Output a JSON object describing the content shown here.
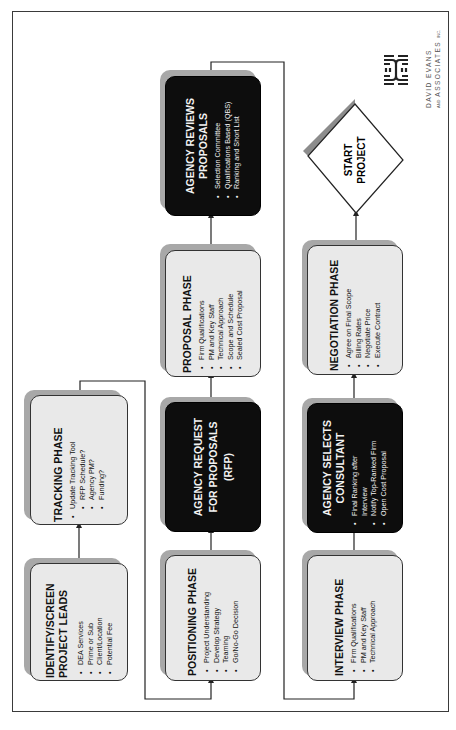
{
  "diagram": {
    "orientation": "rotated 90 degrees counter-clockwise",
    "company": {
      "name_line1": "DAVID EVANS",
      "name_line2": "ASSOCIATES",
      "name_prefix": "AND",
      "name_suffix": "INC."
    },
    "nodes": [
      {
        "id": "identify",
        "title": "IDENTIFY/SCREEN PROJECT LEADS",
        "title_lines": [
          "IDENTIFY/SCREEN",
          "PROJECT LEADS"
        ],
        "style": "light",
        "bullets": [
          "DEA Services",
          "Prime or Sub",
          "Client/Location",
          "Potential Fee"
        ]
      },
      {
        "id": "tracking",
        "title": "TRACKING PHASE",
        "style": "light",
        "bullets": [
          "Update Tracking Tool"
        ],
        "sub_bullets": [
          "RFP Schedule?",
          "Agency PM?",
          "Funding?"
        ]
      },
      {
        "id": "positioning",
        "title": "POSITIONING PHASE",
        "style": "light",
        "bullets": [
          "Project Understanding",
          "Develop Strategy",
          "Teaming",
          "Go/No-Go Decision"
        ]
      },
      {
        "id": "rfp",
        "title": "AGENCY REQUEST FOR PROPOSALS (RFP)",
        "title_lines": [
          "AGENCY REQUEST",
          "FOR PROPOSALS",
          "(RFP)"
        ],
        "style": "dark",
        "bullets": []
      },
      {
        "id": "proposal",
        "title": "PROPOSAL PHASE",
        "style": "light",
        "bullets": [
          "Firm Qualifications",
          "PM and Key Staff",
          "Technical Approach",
          "Scope and Schedule",
          "Sealed  Cost Proposal"
        ]
      },
      {
        "id": "reviews",
        "title": "AGENCY REVIEWS PROPOSALS",
        "title_lines": [
          "AGENCY REVIEWS",
          "PROPOSALS"
        ],
        "style": "dark",
        "bullets": [
          "Selection Committee",
          "Qualifications Based (QBS)",
          "Ranking and Short List"
        ]
      },
      {
        "id": "interview",
        "title": "INTERVIEW PHASE",
        "style": "light",
        "bullets": [
          "Firm Qualifications",
          "PM and Key Staff",
          "Technical Approach"
        ]
      },
      {
        "id": "selects",
        "title": "AGENCY SELECTS CONSULTANT",
        "title_lines": [
          "AGENCY SELECTS",
          "CONSULTANT"
        ],
        "style": "dark",
        "bullets": [
          "Final Ranking after Interview",
          "Notify Top-Ranked Firm",
          "Open Cost Proposal"
        ],
        "bullet_lines": [
          [
            "Final Ranking after",
            "Interview"
          ],
          [
            "Notify Top-Ranked Firm"
          ],
          [
            "Open Cost Proposal"
          ]
        ]
      },
      {
        "id": "negotiation",
        "title": "NEGOTIATION PHASE",
        "style": "light",
        "bullets": [
          "Agree on Final Scope",
          "Billing Rates",
          "Negotiate Price",
          "Execute Contract"
        ]
      },
      {
        "id": "start",
        "title": "START PROJECT",
        "title_lines": [
          "START",
          "PROJECT"
        ],
        "shape": "diamond"
      }
    ],
    "edges": [
      {
        "from": "identify",
        "to": "tracking"
      },
      {
        "from": "tracking",
        "to": "positioning"
      },
      {
        "from": "positioning",
        "to": "rfp"
      },
      {
        "from": "rfp",
        "to": "proposal"
      },
      {
        "from": "proposal",
        "to": "reviews"
      },
      {
        "from": "reviews",
        "to": "interview"
      },
      {
        "from": "interview",
        "to": "selects"
      },
      {
        "from": "selects",
        "to": "negotiation"
      },
      {
        "from": "negotiation",
        "to": "start"
      }
    ],
    "colors": {
      "light_box": "#e9e9e9",
      "dark_box": "#0d0d0d",
      "shadow": "#a8a8a8",
      "line": "#222222"
    }
  }
}
